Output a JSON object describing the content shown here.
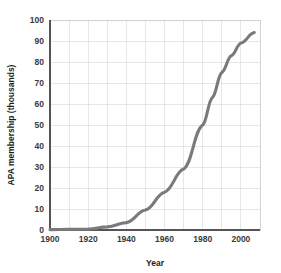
{
  "chart_data": {
    "type": "line",
    "title": "",
    "xlabel": "Year",
    "ylabel": "APA membership (thousands)",
    "xlim": [
      1900,
      2010
    ],
    "ylim": [
      0,
      100
    ],
    "x_ticks": [
      1900,
      1920,
      1940,
      1960,
      1980,
      2000
    ],
    "x_minor_gridlines": [
      1910,
      1930,
      1950,
      1970,
      1990,
      2010
    ],
    "y_ticks": [
      0,
      10,
      20,
      30,
      40,
      50,
      60,
      70,
      80,
      90,
      100
    ],
    "grid": true,
    "legend": "none",
    "series": [
      {
        "name": "APA membership",
        "color": "#7a7a7a",
        "x": [
          1900,
          1910,
          1920,
          1930,
          1940,
          1950,
          1960,
          1970,
          1980,
          1985,
          1990,
          1995,
          2000,
          2007
        ],
        "values": [
          0.2,
          0.3,
          0.4,
          1.5,
          3.5,
          9.5,
          18,
          29,
          50,
          63,
          75,
          83,
          89,
          94
        ]
      }
    ]
  },
  "axis": {
    "y_tick_labels": [
      "100",
      "90",
      "80",
      "70",
      "60",
      "50",
      "40",
      "30",
      "20",
      "10",
      "0"
    ],
    "x_tick_labels": [
      "1900",
      "1920",
      "1940",
      "1960",
      "1980",
      "2000"
    ],
    "x_title": "Year",
    "y_title": "APA membership (thousands)"
  },
  "colors": {
    "line": "#7a7a7a",
    "grid": "#d8dde2",
    "axis": "#555555",
    "text": "#1d1d1d"
  }
}
